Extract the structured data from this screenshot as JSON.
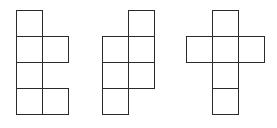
{
  "diagram": {
    "type": "cube-nets",
    "line_color": "#2b2b2b",
    "background": "#ffffff",
    "cell_size": 26,
    "figures": [
      {
        "name": "net-1",
        "origin": [
          16,
          10
        ],
        "cells": [
          [
            0,
            0
          ],
          [
            0,
            1
          ],
          [
            1,
            1
          ],
          [
            0,
            2
          ],
          [
            0,
            3
          ],
          [
            1,
            3
          ]
        ]
      },
      {
        "name": "net-2",
        "origin": [
          102,
          10
        ],
        "cells": [
          [
            1,
            0
          ],
          [
            0,
            1
          ],
          [
            1,
            1
          ],
          [
            0,
            2
          ],
          [
            1,
            2
          ],
          [
            0,
            3
          ]
        ]
      },
      {
        "name": "net-3",
        "origin": [
          186,
          10
        ],
        "cells": [
          [
            1,
            0
          ],
          [
            0,
            1
          ],
          [
            1,
            1
          ],
          [
            2,
            1
          ],
          [
            1,
            2
          ],
          [
            1,
            3
          ]
        ]
      }
    ]
  }
}
